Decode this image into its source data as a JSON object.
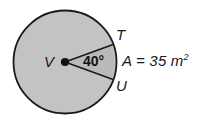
{
  "figure": {
    "type": "circle-sector-diagram",
    "background_color": "#ffffff",
    "circle": {
      "center_label": "V",
      "fill_color": "#c3c3c3",
      "stroke_color": "#1a1a1a",
      "cx": 65,
      "cy": 62,
      "r": 52
    },
    "sector": {
      "angle_label": "40°",
      "angle_degrees": 40,
      "point_upper_label": "T",
      "point_lower_label": "U",
      "vertex_label": "V",
      "stroke_color": "#1a1a1a"
    },
    "annotation": {
      "area_prefix": "A = 35 m",
      "area_exponent": "2",
      "area_full": "A = 35 m²",
      "area_value": 35,
      "area_unit": "m²"
    }
  }
}
